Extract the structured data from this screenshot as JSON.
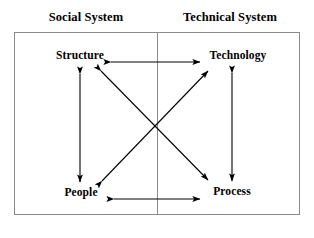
{
  "diagram": {
    "title_left": "Social System",
    "title_right": "Technical System",
    "nodes": {
      "structure": "Structure",
      "technology": "Technology",
      "people": "People",
      "process": "Process"
    },
    "connections": [
      {
        "name": "structure-technology",
        "from": "Structure",
        "to": "Technology",
        "style": "double-headed",
        "orientation": "horizontal"
      },
      {
        "name": "people-process",
        "from": "People",
        "to": "Process",
        "style": "double-headed",
        "orientation": "horizontal"
      },
      {
        "name": "structure-people",
        "from": "Structure",
        "to": "People",
        "style": "double-headed",
        "orientation": "vertical"
      },
      {
        "name": "technology-process",
        "from": "Technology",
        "to": "Process",
        "style": "double-headed",
        "orientation": "vertical"
      },
      {
        "name": "structure-process",
        "from": "Structure",
        "to": "Process",
        "style": "double-headed",
        "orientation": "diagonal"
      },
      {
        "name": "people-technology",
        "from": "People",
        "to": "Technology",
        "style": "double-headed",
        "orientation": "diagonal"
      }
    ],
    "colors": {
      "line": "#000000",
      "frame": "#8a8a8a",
      "text": "#000000",
      "background": "#ffffff"
    }
  }
}
